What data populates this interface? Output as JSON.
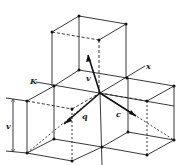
{
  "diagram": {
    "type": "crystal-lattice",
    "labels": {
      "k_axis": "K",
      "x_axis": "x",
      "vector_up": "v",
      "vector_left": "q",
      "vector_right": "c",
      "dimension": "v"
    },
    "colors": {
      "line": "#222222",
      "background": "#ffffff"
    }
  }
}
